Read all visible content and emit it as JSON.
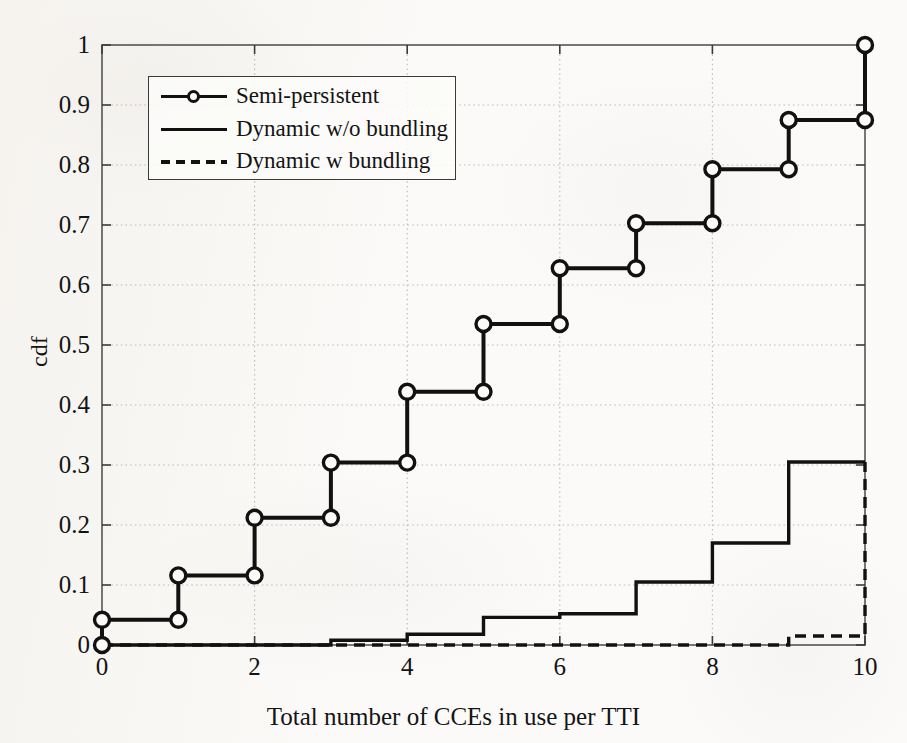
{
  "figure": {
    "background_color": "#fbfaf8",
    "line_color": "#111111",
    "grid_color": "#b9b9b9",
    "axis_color": "#555555"
  },
  "axes": {
    "x_title": "Total number of CCEs in use per TTI",
    "y_title": "cdf",
    "x_ticks": [
      "0",
      "2",
      "4",
      "6",
      "8",
      "10"
    ],
    "y_ticks": [
      "0",
      "0.1",
      "0.2",
      "0.3",
      "0.4",
      "0.5",
      "0.6",
      "0.7",
      "0.8",
      "0.9",
      "1"
    ]
  },
  "legend": {
    "entries": [
      {
        "label": "Semi-persistent",
        "style": "solid-with-circle-markers"
      },
      {
        "label": "Dynamic w/o bundling",
        "style": "solid"
      },
      {
        "label": "Dynamic w bundling",
        "style": "dashed"
      }
    ]
  },
  "chart_data": {
    "type": "line",
    "title": "",
    "subtitle": "",
    "xlabel": "Total number of CCEs in use per TTI",
    "ylabel": "cdf",
    "xlim": [
      0,
      10
    ],
    "ylim": [
      0,
      1
    ],
    "x_ticks": [
      0,
      2,
      4,
      6,
      8,
      10
    ],
    "y_ticks": [
      0,
      0.1,
      0.2,
      0.3,
      0.4,
      0.5,
      0.6,
      0.7,
      0.8,
      0.9,
      1
    ],
    "grid": true,
    "grid_style": "dotted",
    "legend_position": "upper-left-inside",
    "step_style": "post",
    "x": [
      0,
      1,
      2,
      3,
      4,
      5,
      6,
      7,
      8,
      9,
      10
    ],
    "series": [
      {
        "name": "Semi-persistent",
        "style": "solid",
        "marker": "circle-open",
        "values": [
          0.042,
          0.116,
          0.212,
          0.304,
          0.422,
          0.535,
          0.628,
          0.703,
          0.793,
          0.875,
          1.0
        ],
        "start_point": {
          "x": 0,
          "y": 0.0
        }
      },
      {
        "name": "Dynamic w/o bundling",
        "style": "solid",
        "marker": "none",
        "values": [
          0.0,
          0.0,
          0.0,
          0.008,
          0.018,
          0.046,
          0.052,
          0.105,
          0.17,
          0.305,
          0.305
        ]
      },
      {
        "name": "Dynamic w bundling",
        "style": "dashed",
        "marker": "none",
        "values": [
          0.0,
          0.0,
          0.0,
          0.0,
          0.0,
          0.0,
          0.0,
          0.0,
          0.0,
          0.015,
          0.305
        ]
      }
    ]
  }
}
